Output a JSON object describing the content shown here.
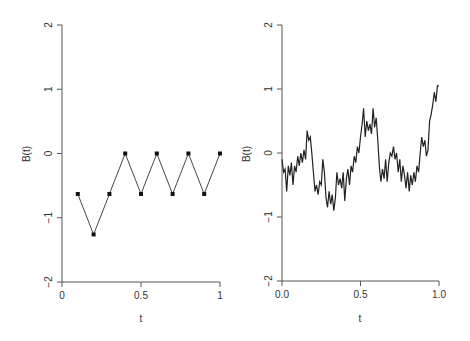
{
  "chart_data": [
    {
      "type": "line",
      "title": "",
      "xlabel": "t",
      "ylabel": "B(t)",
      "xlim": [
        0,
        1
      ],
      "ylim": [
        -2,
        2
      ],
      "grid": false,
      "x_ticks": [
        "0",
        "0.5",
        "1"
      ],
      "y_ticks": [
        "-2",
        "-1",
        "0",
        "1",
        "2"
      ],
      "markers": "square",
      "series": [
        {
          "name": "random walk",
          "x": [
            0.1,
            0.2,
            0.3,
            0.4,
            0.5,
            0.6,
            0.7,
            0.8,
            0.9,
            1.0
          ],
          "values": [
            -0.63,
            -1.26,
            -0.63,
            0.0,
            -0.63,
            0.0,
            -0.63,
            0.0,
            -0.63,
            0.0
          ]
        }
      ]
    },
    {
      "type": "line",
      "title": "",
      "xlabel": "t",
      "ylabel": "B(t)",
      "xlim": [
        0,
        1
      ],
      "ylim": [
        -2,
        2
      ],
      "grid": false,
      "x_ticks": [
        "0.0",
        "0.5",
        "1.0"
      ],
      "y_ticks": [
        "-2",
        "-1",
        "0",
        "1",
        "2"
      ],
      "markers": "none",
      "series": [
        {
          "name": "brownian path",
          "x": [
            0.0,
            0.01,
            0.02,
            0.03,
            0.04,
            0.05,
            0.06,
            0.07,
            0.08,
            0.09,
            0.1,
            0.11,
            0.12,
            0.13,
            0.14,
            0.15,
            0.16,
            0.17,
            0.18,
            0.19,
            0.2,
            0.21,
            0.22,
            0.23,
            0.24,
            0.25,
            0.26,
            0.27,
            0.28,
            0.29,
            0.3,
            0.31,
            0.32,
            0.33,
            0.34,
            0.35,
            0.36,
            0.37,
            0.38,
            0.39,
            0.4,
            0.41,
            0.42,
            0.43,
            0.44,
            0.45,
            0.46,
            0.47,
            0.48,
            0.49,
            0.5,
            0.51,
            0.52,
            0.53,
            0.54,
            0.55,
            0.56,
            0.57,
            0.58,
            0.59,
            0.6,
            0.61,
            0.62,
            0.63,
            0.64,
            0.65,
            0.66,
            0.67,
            0.68,
            0.69,
            0.7,
            0.71,
            0.72,
            0.73,
            0.74,
            0.75,
            0.76,
            0.77,
            0.78,
            0.79,
            0.8,
            0.81,
            0.82,
            0.83,
            0.84,
            0.85,
            0.86,
            0.87,
            0.88,
            0.89,
            0.9,
            0.91,
            0.92,
            0.93,
            0.94,
            0.95,
            0.96,
            0.97,
            0.98,
            0.99,
            1.0
          ],
          "values": [
            -0.1,
            -0.3,
            -0.25,
            -0.6,
            -0.2,
            -0.35,
            -0.15,
            -0.5,
            -0.2,
            -0.3,
            -0.05,
            -0.2,
            0.0,
            -0.15,
            0.05,
            -0.1,
            0.35,
            0.2,
            0.25,
            0.0,
            -0.3,
            -0.6,
            -0.5,
            -0.65,
            -0.45,
            -0.5,
            -0.1,
            -0.3,
            -0.7,
            -0.85,
            -0.6,
            -0.8,
            -0.65,
            -0.9,
            -0.7,
            -0.3,
            -0.5,
            -0.4,
            -0.55,
            -0.3,
            -0.75,
            -0.4,
            -0.25,
            -0.5,
            -0.2,
            -0.3,
            -0.05,
            -0.15,
            0.1,
            0.0,
            0.25,
            0.45,
            0.7,
            0.25,
            0.5,
            0.35,
            0.45,
            0.3,
            0.7,
            0.4,
            0.55,
            0.2,
            -0.2,
            -0.45,
            -0.25,
            -0.4,
            -0.1,
            -0.45,
            -0.15,
            0.0,
            -0.05,
            0.1,
            -0.1,
            0.0,
            -0.3,
            -0.1,
            -0.45,
            -0.2,
            -0.35,
            -0.55,
            -0.3,
            -0.6,
            -0.35,
            -0.5,
            -0.3,
            -0.45,
            -0.2,
            -0.3,
            0.0,
            0.25,
            0.1,
            0.2,
            -0.05,
            0.05,
            0.5,
            0.6,
            0.75,
            0.95,
            0.8,
            1.05,
            1.05
          ]
        }
      ]
    }
  ],
  "panels": [
    {
      "ylabel": "B(t)",
      "xlabel": "t",
      "x_ticks": [
        "0",
        "0.5",
        "1"
      ],
      "y_ticks": [
        "-2",
        "-1",
        "0",
        "1",
        "2"
      ]
    },
    {
      "ylabel": "B(t)",
      "xlabel": "t",
      "x_ticks": [
        "0.0",
        "0.5",
        "1.0"
      ],
      "y_ticks": [
        "-2",
        "-1",
        "0",
        "1",
        "2"
      ]
    }
  ]
}
